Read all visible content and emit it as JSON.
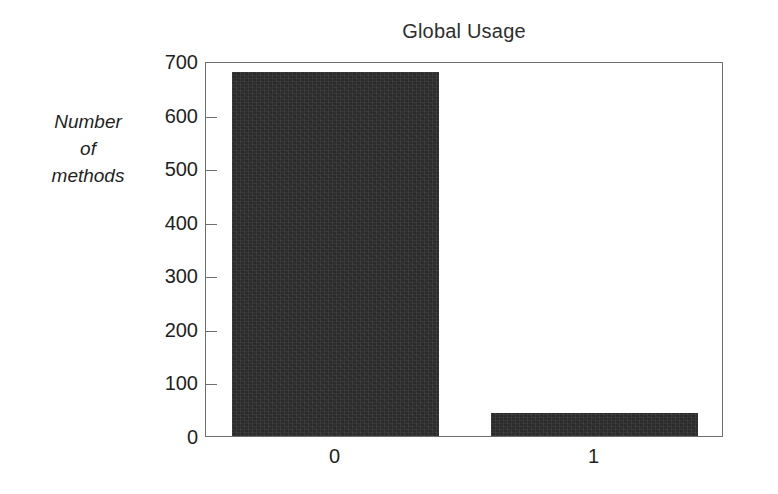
{
  "chart_data": {
    "type": "bar",
    "title": "Global Usage",
    "subtitle": "",
    "xlabel": "",
    "ylabel": "Number of methods",
    "ylabel_lines": [
      "Number",
      "of",
      "methods"
    ],
    "categories": [
      "0",
      "1"
    ],
    "values": [
      680,
      43
    ],
    "series": [
      {
        "name": "Number of methods",
        "values": [
          680,
          43
        ]
      }
    ],
    "ylim": [
      0,
      700
    ],
    "yticks": [
      0,
      100,
      200,
      300,
      400,
      500,
      600,
      700
    ],
    "ytick_labels": [
      "0",
      "100",
      "200",
      "300",
      "400",
      "500",
      "600",
      "700"
    ],
    "grid": false,
    "legend": false,
    "legend_position": "none",
    "bar_color": "#2b2b2b",
    "frame_color": "#6e6e6e",
    "text_color": "#1f1f1f",
    "background": "#ffffff"
  }
}
